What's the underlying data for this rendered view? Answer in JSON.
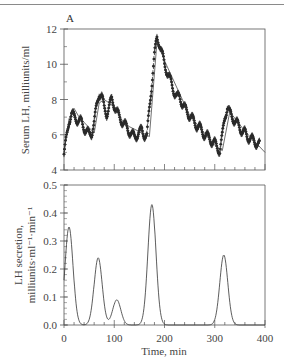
{
  "chart_data": [
    {
      "panel": "A-top",
      "type": "scatter",
      "panel_label": "A",
      "title": "",
      "xlabel": "",
      "ylabel": "Serum LH, milliunits/ml",
      "xlim": [
        0,
        400
      ],
      "ylim": [
        4,
        12
      ],
      "yticks": [
        4,
        6,
        8,
        10,
        12
      ],
      "xticks": [
        0,
        100,
        200,
        300,
        400
      ],
      "grid": false,
      "series": [
        {
          "name": "measured serum LH (with error bars)",
          "style": "markers-with-errorbars",
          "x": [
            0,
            5,
            10,
            15,
            20,
            25,
            30,
            35,
            40,
            45,
            50,
            55,
            60,
            65,
            70,
            75,
            80,
            85,
            90,
            95,
            100,
            105,
            110,
            115,
            120,
            125,
            130,
            135,
            140,
            145,
            150,
            155,
            160,
            165,
            170,
            175,
            180,
            185,
            190,
            195,
            200,
            205,
            210,
            215,
            220,
            225,
            230,
            235,
            240,
            245,
            250,
            255,
            260,
            265,
            270,
            275,
            280,
            285,
            290,
            295,
            300,
            305,
            310,
            315,
            320,
            325,
            330,
            335,
            340,
            345,
            350,
            355,
            360,
            365,
            370,
            375,
            380,
            385,
            390
          ],
          "y": [
            4.9,
            5.8,
            6.8,
            7.2,
            7.0,
            6.9,
            6.8,
            6.7,
            6.4,
            6.2,
            6.0,
            6.1,
            6.7,
            7.6,
            8.4,
            8.2,
            7.5,
            7.2,
            7.6,
            8.0,
            7.7,
            7.3,
            7.0,
            6.8,
            6.6,
            6.4,
            6.2,
            6.0,
            5.9,
            6.0,
            6.1,
            6.3,
            6.0,
            5.9,
            7.5,
            9.0,
            10.5,
            11.5,
            11.2,
            10.6,
            10.0,
            9.6,
            9.2,
            8.8,
            8.4,
            8.1,
            8.2,
            7.8,
            7.5,
            7.3,
            7.1,
            6.9,
            6.7,
            6.5,
            6.4,
            6.2,
            6.0,
            5.9,
            5.8,
            5.6,
            5.5,
            5.3,
            5.1,
            5.9,
            7.0,
            7.6,
            7.2,
            7.0,
            6.8,
            6.6,
            6.4,
            6.2,
            6.1,
            5.9,
            5.8,
            5.7,
            5.6,
            5.5,
            5.4
          ]
        },
        {
          "name": "model fit",
          "style": "line",
          "x": [
            0,
            10,
            20,
            30,
            60,
            70,
            80,
            100,
            120,
            170,
            185,
            200,
            250,
            300,
            315,
            330,
            360,
            400
          ],
          "y": [
            5.0,
            6.9,
            7.5,
            7.0,
            6.1,
            7.8,
            8.0,
            7.6,
            6.6,
            5.9,
            11.3,
            10.2,
            7.1,
            5.4,
            5.1,
            7.3,
            6.2,
            5.0
          ]
        }
      ]
    },
    {
      "panel": "A-bottom",
      "type": "line",
      "title": "",
      "xlabel": "Time, min",
      "ylabel": "LH secretion, milliunits·ml⁻¹·min⁻¹",
      "xlim": [
        0,
        400
      ],
      "ylim": [
        0.0,
        0.5
      ],
      "yticks": [
        0.0,
        0.1,
        0.2,
        0.3,
        0.4,
        0.5
      ],
      "xticks": [
        0,
        100,
        200,
        300,
        400
      ],
      "grid": false,
      "series": [
        {
          "name": "deconvolved secretion pulses",
          "peaks": [
            {
              "center": 10,
              "height": 0.35,
              "width_sd": 8
            },
            {
              "center": 68,
              "height": 0.24,
              "width_sd": 8
            },
            {
              "center": 105,
              "height": 0.09,
              "width_sd": 8
            },
            {
              "center": 175,
              "height": 0.43,
              "width_sd": 8
            },
            {
              "center": 318,
              "height": 0.25,
              "width_sd": 8
            }
          ]
        }
      ]
    }
  ],
  "labels": {
    "panel_label": "A",
    "top_ylabel": "Serum LH, milliunits/ml",
    "bottom_ylabel_line1": "LH secretion,",
    "bottom_ylabel_line2": "milliunits·ml⁻¹·min⁻¹",
    "xlabel": "Time, min",
    "top_yticks": [
      "4",
      "6",
      "8",
      "10",
      "12"
    ],
    "bottom_yticks": [
      "0.0",
      "0.1",
      "0.2",
      "0.3",
      "0.4",
      "0.5"
    ],
    "xticks": [
      "0",
      "100",
      "200",
      "300",
      "400"
    ]
  },
  "colors": {
    "ink": "#2a2a2a",
    "axis": "#555555",
    "background": "#ffffff"
  }
}
